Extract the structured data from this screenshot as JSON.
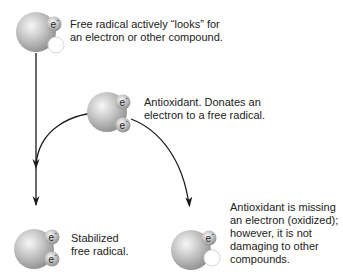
{
  "colors": {
    "sphere_light": "#f2f2f2",
    "sphere_mid": "#bdbdbd",
    "sphere_dark": "#8a8a8a",
    "arrow": "#1a1a1a",
    "text": "#222222",
    "empty_orbital_stroke": "#d8d8d8"
  },
  "electron_symbol": "e",
  "electron_charge": "-",
  "molecules": [
    {
      "id": "free-radical",
      "label_lines": [
        "Free radical actively “looks” for",
        "an electron or other compound."
      ]
    },
    {
      "id": "antioxidant",
      "label_lines": [
        "Antioxidant. Donates an",
        "electron to a free radical."
      ]
    },
    {
      "id": "stabilized-free-radical",
      "label_lines": [
        "Stabilized",
        "free radical."
      ]
    },
    {
      "id": "oxidized-antioxidant",
      "label_lines": [
        "Antioxidant is missing",
        "an electron (oxidized);",
        "however, it is not",
        "damaging to other",
        "compounds."
      ]
    }
  ],
  "arrows": [
    {
      "from": "free-radical",
      "to": "stabilized-free-radical",
      "shape": "straight"
    },
    {
      "from": "antioxidant",
      "to": "stabilized-free-radical",
      "shape": "curve-left"
    },
    {
      "from": "antioxidant",
      "to": "oxidized-antioxidant",
      "shape": "curve-right"
    }
  ]
}
